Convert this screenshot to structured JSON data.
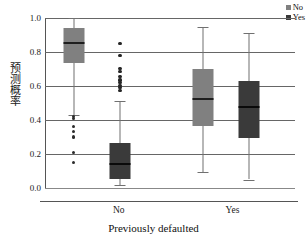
{
  "chart_data": {
    "type": "box",
    "title": "",
    "xlabel": "Previously defaulted",
    "ylabel": "预测概率",
    "ylim": [
      0.0,
      1.0
    ],
    "yticks": [
      "0.0",
      "0.2",
      "0.4",
      "0.6",
      "0.8",
      "1.0"
    ],
    "ytick_values": [
      0.0,
      0.2,
      0.4,
      0.6,
      0.8,
      1.0
    ],
    "grid": true,
    "categories": [
      "No",
      "Yes"
    ],
    "legend_position": "top-right",
    "legend": [
      {
        "label": "No",
        "color": "#808080"
      },
      {
        "label": "Yes",
        "color": "#3a3a3a"
      }
    ],
    "series": [
      {
        "name": "No",
        "color": "#808080",
        "boxes": [
          {
            "category": "No",
            "whisker_low": 0.43,
            "q1": 0.735,
            "median": 0.855,
            "q3": 0.94,
            "whisker_high": 1.0,
            "outliers": [
              0.42,
              0.41,
              0.36,
              0.33,
              0.3,
              0.21,
              0.15
            ]
          },
          {
            "category": "Yes",
            "whisker_low": 0.095,
            "q1": 0.365,
            "median": 0.525,
            "q3": 0.7,
            "whisker_high": 0.95,
            "outliers": []
          }
        ]
      },
      {
        "name": "Yes",
        "color": "#3a3a3a",
        "boxes": [
          {
            "category": "No",
            "whisker_low": 0.015,
            "q1": 0.055,
            "median": 0.14,
            "q3": 0.265,
            "whisker_high": 0.51,
            "outliers": [
              0.85,
              0.78,
              0.705,
              0.685,
              0.655,
              0.635,
              0.62,
              0.605,
              0.59,
              0.575
            ]
          },
          {
            "category": "Yes",
            "whisker_low": 0.05,
            "q1": 0.295,
            "median": 0.475,
            "q3": 0.63,
            "whisker_high": 0.91,
            "outliers": []
          }
        ]
      }
    ]
  },
  "axis": {
    "xlabel": "Previously defaulted",
    "ylabel": "预测概率",
    "xticks": [
      {
        "label": "No",
        "position_pct": 29.5
      },
      {
        "label": "Yes",
        "position_pct": 75.0
      }
    ]
  }
}
